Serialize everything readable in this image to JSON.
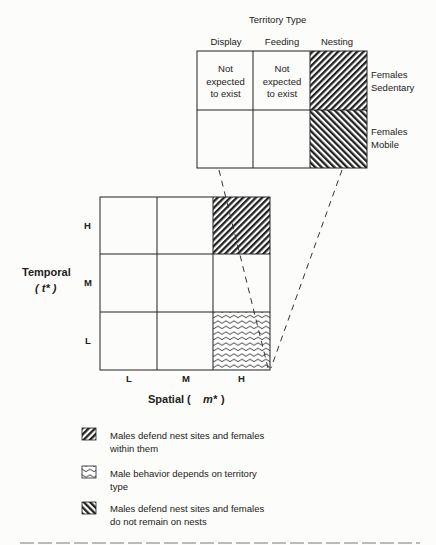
{
  "upper_matrix": {
    "title": "Territory Type",
    "columns": [
      "Display",
      "Feeding",
      "Nesting"
    ],
    "rows": [
      "Females Sedentary",
      "Females Mobile"
    ],
    "row_labels": [
      [
        "Females",
        "Sedentary"
      ],
      [
        "Females",
        "Mobile"
      ]
    ],
    "cells": [
      [
        "Not expected to exist",
        "Not expected to exist",
        "hatch-forward"
      ],
      [
        "",
        "",
        "hatch-back"
      ]
    ],
    "cell_lines": {
      "not_expected": [
        "Not",
        "expected",
        "to exist"
      ]
    }
  },
  "lower_matrix": {
    "y_axis_label": "Temporal",
    "y_axis_symbol": "( t* )",
    "x_axis_label": "Spatial (",
    "x_axis_symbol": "m*",
    "x_axis_close": ")",
    "y_ticks": [
      "H",
      "M",
      "L"
    ],
    "x_ticks": [
      "L",
      "M",
      "H"
    ],
    "cells": [
      [
        "",
        "",
        "hatch-forward"
      ],
      [
        "",
        "",
        ""
      ],
      [
        "",
        "",
        "wavy"
      ]
    ]
  },
  "legend": [
    {
      "pattern": "hatch-forward",
      "lines": [
        "Males defend nest sites and females",
        "within them"
      ]
    },
    {
      "pattern": "wavy",
      "lines": [
        "Male behavior depends on territory",
        "type"
      ]
    },
    {
      "pattern": "hatch-back",
      "lines": [
        "Males defend nest sites and females",
        "do not remain on nests"
      ]
    }
  ],
  "colors": {
    "ink": "#222222",
    "paper": "#fcfcfa"
  }
}
